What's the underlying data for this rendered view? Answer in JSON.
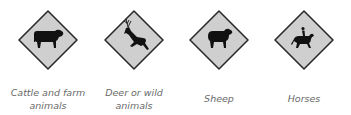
{
  "signs": [
    {
      "id": "cattle",
      "label": "Cattle and farm animals",
      "line1": "Cattle and farm",
      "line2": "animals",
      "icon": "cow-icon"
    },
    {
      "id": "deer",
      "label": "Deer or wild animals",
      "line1": "Deer or wild",
      "line2": "animals",
      "icon": "deer-icon"
    },
    {
      "id": "sheep",
      "label": "Sheep",
      "line1": "Sheep",
      "icon": "sheep-icon"
    },
    {
      "id": "horses",
      "label": "Horses",
      "line1": "Horses",
      "icon": "horse-rider-icon"
    }
  ],
  "colors": {
    "sign_fill": "#cfcfcf",
    "sign_border": "#2b2b2b",
    "symbol": "#111111",
    "label": "#6a6a6a"
  }
}
